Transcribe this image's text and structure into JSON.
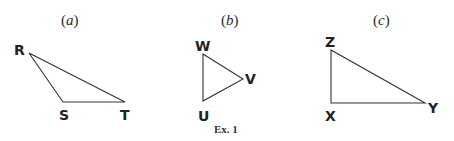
{
  "figure_caption": "Ex. 1",
  "panels": [
    {
      "label": "(a)",
      "label_letter": "a",
      "vertices": {
        "R": "R",
        "S": "S",
        "T": "T"
      },
      "triangle": "RST"
    },
    {
      "label": "(b)",
      "label_letter": "b",
      "vertices": {
        "W": "W",
        "V": "V",
        "U": "U"
      },
      "triangle": "WVU"
    },
    {
      "label": "(c)",
      "label_letter": "c",
      "vertices": {
        "Z": "Z",
        "X": "X",
        "Y": "Y"
      },
      "triangle": "ZXY"
    }
  ]
}
